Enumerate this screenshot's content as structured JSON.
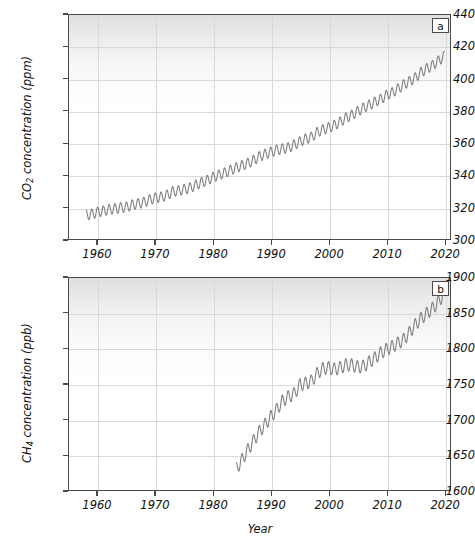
{
  "figure": {
    "background_color": "#ffffff",
    "line_color": "#808080",
    "axis_color": "#4a4a4a",
    "grid_color": "#d9d9d9",
    "xlabel": "Year"
  },
  "panels": [
    {
      "tag": "a",
      "ylabel_prefix": "CO",
      "ylabel_sub": "2",
      "ylabel_suffix": " concentration (ppm)",
      "yticks": [
        "300",
        "320",
        "340",
        "360",
        "380",
        "400",
        "420",
        "440"
      ],
      "xticks": [
        "1960",
        "1970",
        "1980",
        "1990",
        "2000",
        "2010",
        "2020"
      ]
    },
    {
      "tag": "b",
      "ylabel_prefix": "CH",
      "ylabel_sub": "4",
      "ylabel_suffix": " concentration (ppb)",
      "yticks": [
        "1600",
        "1650",
        "1700",
        "1750",
        "1800",
        "1850",
        "1900"
      ],
      "xticks": [
        "1960",
        "1970",
        "1980",
        "1990",
        "2000",
        "2010",
        "2020"
      ]
    }
  ],
  "chart_data": [
    {
      "type": "line",
      "panel": "a",
      "title": "",
      "xlabel": "Year",
      "ylabel": "CO2 concentration (ppm)",
      "xlim": [
        1955,
        2021
      ],
      "ylim": [
        300,
        440
      ],
      "xticks": [
        1960,
        1970,
        1980,
        1990,
        2000,
        2010,
        2020
      ],
      "yticks": [
        300,
        320,
        340,
        360,
        380,
        400,
        420,
        440
      ],
      "grid": true,
      "legend": "none",
      "annotation": "a",
      "seasonal_amplitude_ppm": 3.2,
      "series": [
        {
          "name": "CO2 annual mean (Mauna Loa)",
          "x": [
            1958,
            1959,
            1960,
            1961,
            1962,
            1963,
            1964,
            1965,
            1966,
            1967,
            1968,
            1969,
            1970,
            1971,
            1972,
            1973,
            1974,
            1975,
            1976,
            1977,
            1978,
            1979,
            1980,
            1981,
            1982,
            1983,
            1984,
            1985,
            1986,
            1987,
            1988,
            1989,
            1990,
            1991,
            1992,
            1993,
            1994,
            1995,
            1996,
            1997,
            1998,
            1999,
            2000,
            2001,
            2002,
            2003,
            2004,
            2005,
            2006,
            2007,
            2008,
            2009,
            2010,
            2011,
            2012,
            2013,
            2014,
            2015,
            2016,
            2017,
            2018,
            2019,
            2020
          ],
          "values": [
            315.0,
            315.6,
            316.9,
            317.6,
            318.5,
            319.0,
            319.6,
            320.0,
            321.4,
            322.2,
            323.0,
            324.6,
            325.7,
            326.3,
            327.5,
            329.7,
            330.2,
            331.1,
            332.0,
            333.8,
            335.4,
            336.8,
            338.7,
            340.1,
            341.4,
            343.0,
            344.6,
            346.0,
            347.4,
            349.2,
            351.6,
            353.1,
            354.4,
            355.6,
            356.4,
            357.1,
            358.8,
            360.8,
            362.6,
            363.7,
            366.7,
            368.4,
            369.6,
            371.1,
            373.2,
            375.8,
            377.5,
            379.8,
            381.9,
            383.8,
            385.6,
            387.4,
            389.9,
            391.6,
            393.9,
            396.5,
            398.6,
            400.8,
            404.2,
            406.6,
            408.5,
            411.4,
            414.2
          ]
        }
      ]
    },
    {
      "type": "line",
      "panel": "b",
      "title": "",
      "xlabel": "Year",
      "ylabel": "CH4 concentration (ppb)",
      "xlim": [
        1955,
        2021
      ],
      "ylim": [
        1600,
        1900
      ],
      "xticks": [
        1960,
        1970,
        1980,
        1990,
        2000,
        2010,
        2020
      ],
      "yticks": [
        1600,
        1650,
        1700,
        1750,
        1800,
        1850,
        1900
      ],
      "grid": true,
      "legend": "none",
      "annotation": "b",
      "seasonal_amplitude_ppb": 9.0,
      "series": [
        {
          "name": "CH4 annual mean (NOAA global)",
          "x": [
            1984,
            1985,
            1986,
            1987,
            1988,
            1989,
            1990,
            1991,
            1992,
            1993,
            1994,
            1995,
            1996,
            1997,
            1998,
            1999,
            2000,
            2001,
            2002,
            2003,
            2004,
            2005,
            2006,
            2007,
            2008,
            2009,
            2010,
            2011,
            2012,
            2013,
            2014,
            2015,
            2016,
            2017,
            2018,
            2019,
            2020
          ],
          "values": [
            1630,
            1643,
            1657,
            1670,
            1683,
            1693,
            1704,
            1714,
            1726,
            1732,
            1736,
            1749,
            1751,
            1754,
            1765,
            1772,
            1773,
            1771,
            1773,
            1777,
            1777,
            1774,
            1775,
            1781,
            1787,
            1794,
            1799,
            1803,
            1808,
            1813,
            1823,
            1834,
            1843,
            1850,
            1857,
            1866,
            1879
          ]
        }
      ]
    }
  ]
}
